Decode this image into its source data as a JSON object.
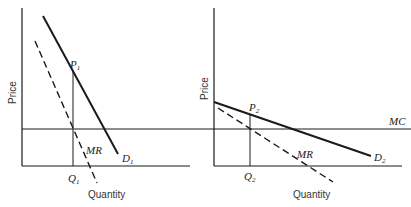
{
  "colors": {
    "line": "#1a1a1a",
    "background": "#ffffff"
  },
  "panels": [
    {
      "id": "left",
      "ylabel": "Price",
      "xlabel": "Quantity",
      "demand": {
        "label": "D",
        "sub": "1"
      },
      "mr": {
        "label": "MR"
      },
      "price_point": {
        "label": "P",
        "sub": "1"
      },
      "quantity_point": {
        "label": "Q",
        "sub": "1"
      }
    },
    {
      "id": "right",
      "ylabel": "Price",
      "xlabel": "Quantity",
      "demand": {
        "label": "D",
        "sub": "2"
      },
      "mr": {
        "label": "MR"
      },
      "price_point": {
        "label": "P",
        "sub": "2"
      },
      "quantity_point": {
        "label": "Q",
        "sub": "2"
      },
      "mc": {
        "label": "MC"
      }
    }
  ]
}
